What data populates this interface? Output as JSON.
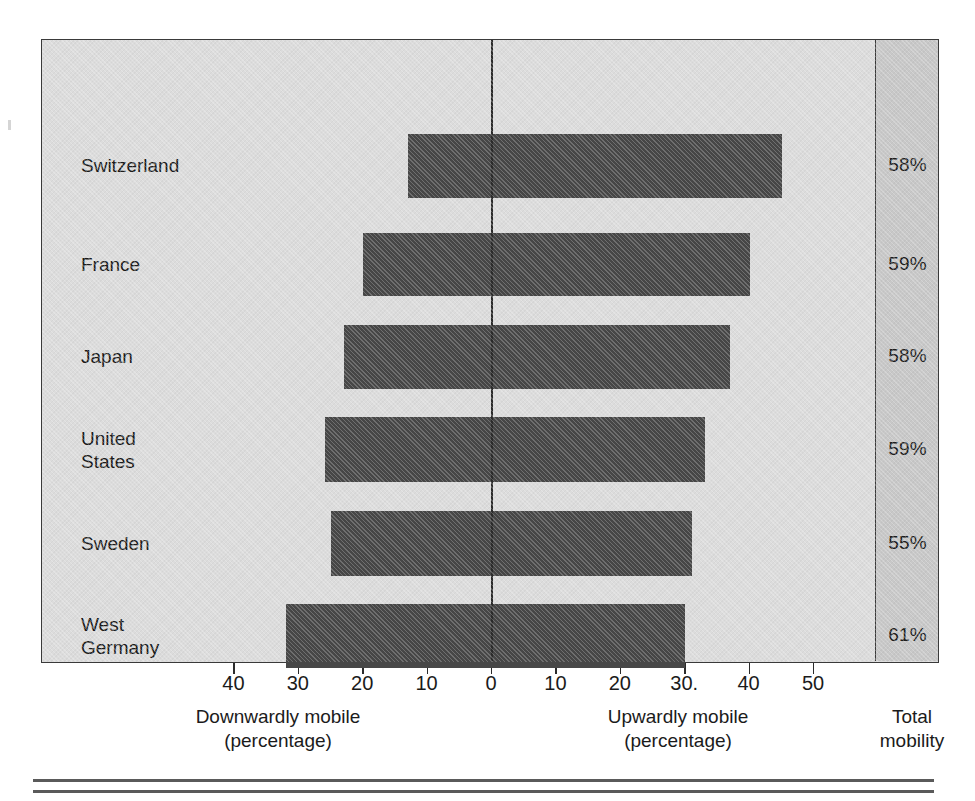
{
  "chart_data": {
    "type": "bar",
    "orientation": "horizontal",
    "style": "diverging",
    "title": "",
    "subtitle": "",
    "categories": [
      "Switzerland",
      "France",
      "Japan",
      "United\nStates",
      "Sweden",
      "West\nGermany"
    ],
    "series": [
      {
        "name": "Downwardly mobile",
        "values": [
          13,
          20,
          23,
          26,
          25,
          32
        ]
      },
      {
        "name": "Upwardly mobile",
        "values": [
          45,
          40,
          37,
          33,
          31,
          30
        ]
      }
    ],
    "totals_label": "Total\nmobility",
    "totals": [
      "58%",
      "59%",
      "58%",
      "59%",
      "55%",
      "61%"
    ],
    "xlabel_left": "Downwardly mobile\n(percentage)",
    "xlabel_right": "Upwardly mobile\n(percentage)",
    "ylabel": "",
    "xlim": [
      -45,
      57
    ],
    "tick_values": [
      -40,
      -30,
      -20,
      -10,
      0,
      10,
      20,
      30,
      40,
      50
    ],
    "tick_labels": [
      "40",
      "30",
      "20",
      "10",
      "0",
      "10",
      "20",
      "30.",
      "40",
      "50"
    ],
    "grid": false,
    "legend": "none",
    "colors": {
      "bar": "#474747",
      "plot_background": "#dcdcdc",
      "total_panel_background": "#c8c8c8",
      "frame": "#3a3a3a",
      "text": "#1b1b1b"
    }
  },
  "axis": {
    "zero_value": 0,
    "pixels_per_unit": 6.44,
    "zero_x": 491
  },
  "captions": {
    "down": "Downwardly mobile\n(percentage)",
    "up": "Upwardly mobile\n(percentage)",
    "total": "Total\nmobility"
  },
  "rows": [
    {
      "label": "Switzerland",
      "down": 13,
      "up": 45,
      "total": "58%",
      "top": 94,
      "height": 64
    },
    {
      "label": "France",
      "down": 20,
      "up": 40,
      "total": "59%",
      "top": 193,
      "height": 63
    },
    {
      "label": "Japan",
      "down": 23,
      "up": 37,
      "total": "58%",
      "top": 285,
      "height": 64
    },
    {
      "label": "United\nStates",
      "down": 26,
      "up": 33,
      "total": "59%",
      "top": 377,
      "height": 65
    },
    {
      "label": "Sweden",
      "down": 25,
      "up": 31,
      "total": "55%",
      "top": 471,
      "height": 65
    },
    {
      "label": "West\nGermany",
      "down": 32,
      "up": 30,
      "total": "61%",
      "top": 564,
      "height": 64
    }
  ]
}
